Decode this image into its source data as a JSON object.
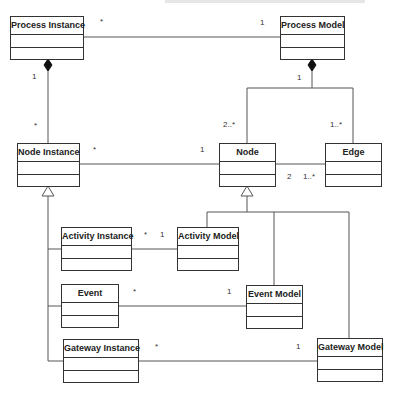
{
  "diagram": {
    "type": "UML class diagram",
    "classes": [
      {
        "id": "process_instance",
        "name": "Process Instance"
      },
      {
        "id": "process_model",
        "name": "Process Model"
      },
      {
        "id": "node_instance",
        "name": "Node Instance"
      },
      {
        "id": "node",
        "name": "Node"
      },
      {
        "id": "edge",
        "name": "Edge"
      },
      {
        "id": "activity_instance",
        "name": "Activity Instance"
      },
      {
        "id": "activity_model",
        "name": "Activity Model"
      },
      {
        "id": "event",
        "name": "Event"
      },
      {
        "id": "event_model",
        "name": "Event Model"
      },
      {
        "id": "gateway_instance",
        "name": "Gateway Instance"
      },
      {
        "id": "gateway_model",
        "name": "Gateway Model"
      }
    ],
    "relations": [
      {
        "type": "association",
        "from": "Process Instance",
        "to": "Process Model",
        "from_mult": "*",
        "to_mult": "1"
      },
      {
        "type": "composition",
        "whole": "Process Instance",
        "part": "Node Instance",
        "whole_mult": "1",
        "part_mult": "*"
      },
      {
        "type": "composition",
        "whole": "Process Model",
        "part": "Node",
        "whole_mult": "1",
        "part_mult": "2..*"
      },
      {
        "type": "composition",
        "whole": "Process Model",
        "part": "Edge",
        "whole_mult": "1",
        "part_mult": "1..*"
      },
      {
        "type": "association",
        "from": "Node Instance",
        "to": "Node",
        "from_mult": "*",
        "to_mult": "1"
      },
      {
        "type": "association",
        "from": "Node",
        "to": "Edge",
        "from_mult": "2",
        "to_mult": "1..*"
      },
      {
        "type": "generalization",
        "parent": "Node Instance",
        "children": [
          "Activity Instance",
          "Event",
          "Gateway Instance"
        ]
      },
      {
        "type": "generalization",
        "parent": "Node",
        "children": [
          "Activity Model",
          "Event Model",
          "Gateway Model"
        ]
      },
      {
        "type": "association",
        "from": "Activity Instance",
        "to": "Activity Model",
        "from_mult": "*",
        "to_mult": "1"
      },
      {
        "type": "association",
        "from": "Event",
        "to": "Event Model",
        "from_mult": "*",
        "to_mult": "1"
      },
      {
        "type": "association",
        "from": "Gateway Instance",
        "to": "Gateway Model",
        "from_mult": "*",
        "to_mult": "1"
      }
    ],
    "labels": {
      "pi_pm_star": "*",
      "pi_pm_one": "1",
      "pi_ni_one": "1",
      "pi_ni_star": "*",
      "pm_comp_one": "1",
      "pm_node": "2..*",
      "pm_edge": "1..*",
      "ni_node_star": "*",
      "ni_node_one": "1",
      "node_edge_two": "2",
      "node_edge_many": "1..*",
      "ai_am_star": "*",
      "ai_am_one": "1",
      "ev_em_star": "*",
      "ev_em_one": "1",
      "gi_gm_star": "*",
      "gi_gm_one": "1"
    }
  }
}
